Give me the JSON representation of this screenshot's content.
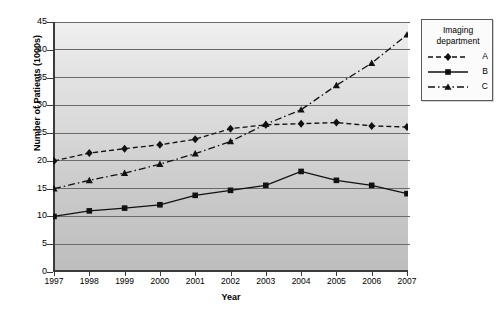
{
  "chart_data": {
    "type": "line",
    "title": "",
    "xlabel": "Year",
    "ylabel": "Number of Patients (1000s)",
    "categories": [
      "1997",
      "1998",
      "1999",
      "2000",
      "2001",
      "2002",
      "2003",
      "2004",
      "2005",
      "2006",
      "2007"
    ],
    "ylim": [
      0,
      45
    ],
    "ytick_step": 5,
    "yticks": [
      "0",
      "5",
      "10",
      "15",
      "20",
      "25",
      "30",
      "35",
      "40",
      "45"
    ],
    "grid": true,
    "legend_position": "right",
    "legend_title": "Imaging department",
    "series": [
      {
        "name": "A",
        "marker": "diamond",
        "linestyle": "dashed",
        "color": "#111111",
        "values": [
          20,
          21.4,
          22.2,
          22.9,
          23.9,
          25.8,
          26.5,
          26.7,
          26.9,
          26.3,
          26.1
        ]
      },
      {
        "name": "B",
        "marker": "square",
        "linestyle": "solid",
        "color": "#111111",
        "values": [
          10,
          11,
          11.5,
          12.1,
          13.8,
          14.7,
          15.6,
          18.1,
          16.5,
          15.6,
          14.1
        ]
      },
      {
        "name": "C",
        "marker": "triangle",
        "linestyle": "dashdot",
        "color": "#111111",
        "values": [
          15,
          16.5,
          17.8,
          19.4,
          21.3,
          23.5,
          26.6,
          29.2,
          33.6,
          37.6,
          42.7
        ]
      }
    ]
  },
  "legend": {
    "title_line1": "Imaging",
    "title_line2": "department",
    "entries": [
      {
        "label": "A"
      },
      {
        "label": "B"
      },
      {
        "label": "C"
      }
    ]
  },
  "axes": {
    "xlabel": "Year",
    "ylabel": "Number of Patients (1000s)"
  }
}
